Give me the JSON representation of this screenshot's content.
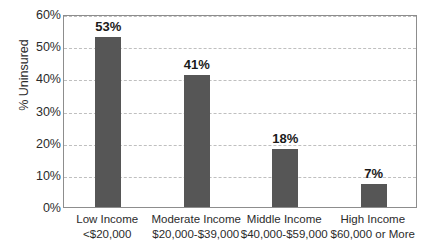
{
  "chart_data": {
    "type": "bar",
    "title": "",
    "xlabel": "",
    "ylabel": "% Uninsured",
    "ylim": [
      0,
      60
    ],
    "grid": true,
    "legend": null,
    "categories": [
      "Low Income <$20,000",
      "Moderate Income $20,000-$39,000",
      "Middle Income $40,000-$59,000",
      "High Income $60,000 or More"
    ],
    "category_lines": [
      {
        "line1": "Low Income",
        "line2": "<$20,000"
      },
      {
        "line1": "Moderate Income",
        "line2": "$20,000-$39,000"
      },
      {
        "line1": "Middle Income",
        "line2": "$40,000-$59,000"
      },
      {
        "line1": "High Income",
        "line2": "$60,000 or More"
      }
    ],
    "values": [
      53,
      41,
      18,
      7
    ],
    "value_labels": [
      "53%",
      "41%",
      "18%",
      "7%"
    ],
    "ytick_values": [
      60,
      50,
      40,
      30,
      20,
      10,
      0
    ],
    "ytick_labels": [
      "60%",
      "50%",
      "40%",
      "30%",
      "20%",
      "10%",
      "0%"
    ],
    "colors": {
      "bar": "#565656",
      "gridline": "#bfbfbf",
      "axis_border": "#8d8d8d",
      "text": "#2b2b2b",
      "value_label": "#1a1a1a",
      "background": "#ffffff"
    }
  },
  "title_remnant": "",
  "axis": {
    "y_title": "% Uninsured"
  }
}
